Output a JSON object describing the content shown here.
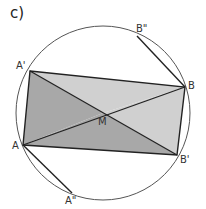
{
  "panel": {
    "label": "c)"
  },
  "points": {
    "A_prime": {
      "label": "A'",
      "x": 30,
      "y": 71
    },
    "B": {
      "label": "B",
      "x": 185,
      "y": 87
    },
    "B_prime": {
      "label": "B'",
      "x": 177,
      "y": 155
    },
    "A": {
      "label": "A",
      "x": 23,
      "y": 145
    },
    "M": {
      "label": "M",
      "x": 103,
      "y": 113
    },
    "B_double_prime": {
      "label": "B\"",
      "x": 137,
      "y": 36
    },
    "A_double_prime": {
      "label": "A\"",
      "x": 72,
      "y": 193
    }
  },
  "circle": {
    "cx": 103,
    "cy": 113,
    "r": 87
  },
  "colors": {
    "light_fill": "#d0d0d0",
    "dark_fill": "#a8a8a8",
    "stroke": "#222222",
    "circle_stroke": "#555555"
  }
}
